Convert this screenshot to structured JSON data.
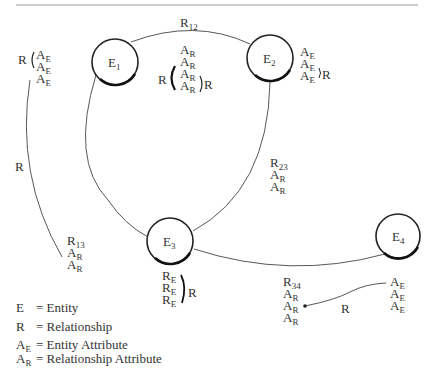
{
  "diagram": {
    "type": "entity-relationship",
    "entities": [
      {
        "id": "E1",
        "label": "E",
        "sub": "1"
      },
      {
        "id": "E2",
        "label": "E",
        "sub": "2"
      },
      {
        "id": "E3",
        "label": "E",
        "sub": "3"
      },
      {
        "id": "E4",
        "label": "E",
        "sub": "4"
      }
    ],
    "relationships": [
      {
        "id": "R12",
        "label": "R",
        "sub": "12",
        "attributes": [
          "A_R",
          "A_R",
          "A_R",
          "A_R"
        ],
        "bracket_left": "R",
        "bracket_right": "R"
      },
      {
        "id": "R23",
        "label": "R",
        "sub": "23",
        "attributes": [
          "A_R",
          "A_R"
        ]
      },
      {
        "id": "R13",
        "label": "R",
        "sub": "13",
        "attributes": [
          "A_R",
          "A_R"
        ]
      },
      {
        "id": "R34",
        "label": "R",
        "sub": "34",
        "attributes": [
          "A_R",
          "A_R",
          "A_R"
        ]
      }
    ],
    "left_group": {
      "bracket_label": "R",
      "attributes": [
        "A_E",
        "A_E",
        "A_E"
      ],
      "curve_label": "R"
    },
    "e2_group": {
      "attributes": [
        "A_E",
        "A_E",
        "A_E"
      ],
      "bracket_label": "R"
    },
    "e3_group": {
      "items": [
        "R_E",
        "R_E",
        "R_E"
      ],
      "bracket_label": "R"
    },
    "e4_group": {
      "attributes": [
        "A_E",
        "A_E",
        "A_E"
      ],
      "link_label": "R"
    },
    "legend": [
      {
        "key": "E",
        "key_sub": "",
        "text": "= Entity"
      },
      {
        "key": "R",
        "key_sub": "",
        "text": "= Relationship"
      },
      {
        "key": "A",
        "key_sub": "E",
        "text": "= Entity Attribute"
      },
      {
        "key": "A",
        "key_sub": "R",
        "text": "= Relationship Attribute"
      }
    ],
    "letters": {
      "A": "A",
      "R": "R",
      "E": "E",
      "sub_E": "E",
      "sub_R": "R"
    }
  }
}
